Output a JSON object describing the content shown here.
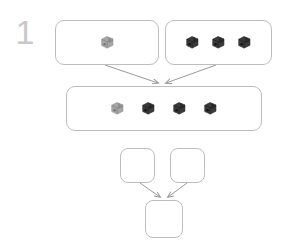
{
  "diagram": {
    "step_label": "1",
    "type": "flow-merge-diagram",
    "colors": {
      "box_border": "#bdbdbd",
      "box_fill": "#ffffff",
      "arrow": "#9a9a9a",
      "step_number": "#c9c9c9",
      "cube_light": "#9a9a9a",
      "cube_dark": "#333333"
    },
    "nodes": [
      {
        "id": "source-left",
        "name": "source-group-left",
        "items": [
          {
            "icon": "cube-icon",
            "variant": "light"
          }
        ]
      },
      {
        "id": "source-right",
        "name": "source-group-right",
        "items": [
          {
            "icon": "cube-icon",
            "variant": "dark"
          },
          {
            "icon": "cube-icon",
            "variant": "dark"
          },
          {
            "icon": "cube-icon",
            "variant": "dark"
          }
        ]
      },
      {
        "id": "merged",
        "name": "merged-group",
        "items": [
          {
            "icon": "cube-icon",
            "variant": "light"
          },
          {
            "icon": "cube-icon",
            "variant": "dark"
          },
          {
            "icon": "cube-icon",
            "variant": "dark"
          },
          {
            "icon": "cube-icon",
            "variant": "dark"
          }
        ]
      },
      {
        "id": "empty-left",
        "name": "empty-group-left",
        "items": []
      },
      {
        "id": "empty-right",
        "name": "empty-group-right",
        "items": []
      },
      {
        "id": "empty-merged",
        "name": "empty-merged-group",
        "items": []
      }
    ],
    "edges": [
      {
        "from": "source-left",
        "to": "merged",
        "name": "edge-source-left-to-merged"
      },
      {
        "from": "source-right",
        "to": "merged",
        "name": "edge-source-right-to-merged"
      },
      {
        "from": "empty-left",
        "to": "empty-merged",
        "name": "edge-empty-left-to-merged"
      },
      {
        "from": "empty-right",
        "to": "empty-merged",
        "name": "edge-empty-right-to-merged"
      }
    ]
  }
}
